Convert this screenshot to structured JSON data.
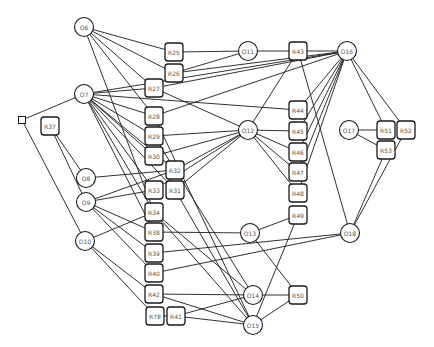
{
  "diagram": {
    "colors": {
      "stroke": "#1a1a1a",
      "fill": "#ffffff",
      "label": "#555555",
      "background": "#ffffff"
    },
    "circle_nodes": [
      {
        "id": "O6",
        "label": "O6",
        "x": 84,
        "y": 27
      },
      {
        "id": "O7",
        "label": "O7",
        "x": 84,
        "y": 94
      },
      {
        "id": "O8",
        "label": "O8",
        "x": 86,
        "y": 178
      },
      {
        "id": "O9",
        "label": "O9",
        "x": 86,
        "y": 202
      },
      {
        "id": "O10",
        "label": "O10",
        "x": 85,
        "y": 241
      },
      {
        "id": "O11",
        "label": "O11",
        "x": 248,
        "y": 51
      },
      {
        "id": "O12",
        "label": "O12",
        "x": 248,
        "y": 130
      },
      {
        "id": "O13",
        "label": "O13",
        "x": 250,
        "y": 233
      },
      {
        "id": "O14",
        "label": "O14",
        "x": 253,
        "y": 295
      },
      {
        "id": "O15",
        "label": "O15",
        "x": 253,
        "y": 325
      },
      {
        "id": "O16",
        "label": "O16",
        "x": 347,
        "y": 51
      },
      {
        "id": "O17",
        "label": "O17",
        "x": 349,
        "y": 130
      },
      {
        "id": "O18",
        "label": "O18",
        "x": 350,
        "y": 233
      }
    ],
    "rect_nodes": [
      {
        "id": "R25",
        "label": "R25",
        "x": 174,
        "y": 52
      },
      {
        "id": "R26",
        "label": "R26",
        "x": 174,
        "y": 73
      },
      {
        "id": "R27",
        "label": "R27",
        "x": 154,
        "y": 88
      },
      {
        "id": "R28",
        "label": "R28",
        "x": 154,
        "y": 116
      },
      {
        "id": "R29",
        "label": "R29",
        "x": 154,
        "y": 136
      },
      {
        "id": "R30",
        "label": "R30",
        "x": 154,
        "y": 156
      },
      {
        "id": "R32",
        "label": "R32",
        "x": 175,
        "y": 170
      },
      {
        "id": "R33",
        "label": "R33",
        "x": 154,
        "y": 190
      },
      {
        "id": "R31",
        "label": "R31",
        "x": 175,
        "y": 190
      },
      {
        "id": "R34",
        "label": "R34",
        "x": 154,
        "y": 212
      },
      {
        "id": "R38",
        "label": "R38",
        "x": 154,
        "y": 232
      },
      {
        "id": "R39",
        "label": "R39",
        "x": 154,
        "y": 253
      },
      {
        "id": "R40",
        "label": "R40",
        "x": 154,
        "y": 273
      },
      {
        "id": "R42",
        "label": "R42",
        "x": 154,
        "y": 294
      },
      {
        "id": "R78",
        "label": "R78",
        "x": 155,
        "y": 316
      },
      {
        "id": "R41",
        "label": "R41",
        "x": 176,
        "y": 316
      },
      {
        "id": "R37",
        "label": "R37",
        "x": 50,
        "y": 126
      },
      {
        "id": "R43",
        "label": "R43",
        "x": 298,
        "y": 51
      },
      {
        "id": "R44",
        "label": "R44",
        "x": 298,
        "y": 110
      },
      {
        "id": "R45",
        "label": "R45",
        "x": 298,
        "y": 131
      },
      {
        "id": "R46",
        "label": "R46",
        "x": 298,
        "y": 152
      },
      {
        "id": "R47",
        "label": "R47",
        "x": 298,
        "y": 172
      },
      {
        "id": "R48",
        "label": "R48",
        "x": 298,
        "y": 193
      },
      {
        "id": "R49",
        "label": "R49",
        "x": 298,
        "y": 215
      },
      {
        "id": "R50",
        "label": "R50",
        "x": 298,
        "y": 295
      },
      {
        "id": "R51",
        "label": "R51",
        "x": 386,
        "y": 130
      },
      {
        "id": "R52",
        "label": "R52",
        "x": 406,
        "y": 130
      },
      {
        "id": "R53",
        "label": "R53",
        "x": 386,
        "y": 150
      }
    ],
    "small_nodes": [
      {
        "id": "S0",
        "x": 22,
        "y": 120
      }
    ],
    "edges": [
      [
        "O6",
        "R25"
      ],
      [
        "O6",
        "R26"
      ],
      [
        "O6",
        "R27"
      ],
      [
        "O6",
        "R28"
      ],
      [
        "O6",
        "R34"
      ],
      [
        "O7",
        "S0"
      ],
      [
        "O7",
        "R27"
      ],
      [
        "O7",
        "R28"
      ],
      [
        "O7",
        "R29"
      ],
      [
        "O7",
        "R30"
      ],
      [
        "O7",
        "R32"
      ],
      [
        "O7",
        "R33"
      ],
      [
        "O7",
        "R31"
      ],
      [
        "O7",
        "R34"
      ],
      [
        "O7",
        "R38"
      ],
      [
        "O7",
        "R44"
      ],
      [
        "O7",
        "O16"
      ],
      [
        "S0",
        "O10"
      ],
      [
        "R37",
        "O8"
      ],
      [
        "R37",
        "O9"
      ],
      [
        "O8",
        "R32"
      ],
      [
        "O9",
        "R33"
      ],
      [
        "O9",
        "R32"
      ],
      [
        "O9",
        "R38"
      ],
      [
        "O9",
        "R39"
      ],
      [
        "O9",
        "R40"
      ],
      [
        "O10",
        "R34"
      ],
      [
        "O10",
        "R42"
      ],
      [
        "O10",
        "R78"
      ],
      [
        "R25",
        "O11"
      ],
      [
        "R26",
        "O11"
      ],
      [
        "R26",
        "O16"
      ],
      [
        "R27",
        "O16"
      ],
      [
        "R27",
        "O12"
      ],
      [
        "R28",
        "O16"
      ],
      [
        "R28",
        "O15"
      ],
      [
        "R29",
        "O12"
      ],
      [
        "R29",
        "O14"
      ],
      [
        "R30",
        "O12"
      ],
      [
        "R32",
        "O12"
      ],
      [
        "R31",
        "O12"
      ],
      [
        "R31",
        "O15"
      ],
      [
        "R33",
        "O12"
      ],
      [
        "R34",
        "O14"
      ],
      [
        "R34",
        "O15"
      ],
      [
        "R38",
        "O13"
      ],
      [
        "R39",
        "O18"
      ],
      [
        "R40",
        "O18"
      ],
      [
        "R42",
        "O14"
      ],
      [
        "R42",
        "O15"
      ],
      [
        "R78",
        "R41"
      ],
      [
        "R41",
        "O14"
      ],
      [
        "R41",
        "O15"
      ],
      [
        "O11",
        "R43"
      ],
      [
        "O12",
        "R43"
      ],
      [
        "O12",
        "R45"
      ],
      [
        "O12",
        "R46"
      ],
      [
        "O12",
        "R47"
      ],
      [
        "O12",
        "R48"
      ],
      [
        "R43",
        "O16"
      ],
      [
        "R43",
        "O18"
      ],
      [
        "R44",
        "O16"
      ],
      [
        "R45",
        "O16"
      ],
      [
        "R46",
        "O16"
      ],
      [
        "R47",
        "O16"
      ],
      [
        "R48",
        "O16"
      ],
      [
        "O13",
        "R49"
      ],
      [
        "O13",
        "R50"
      ],
      [
        "R49",
        "O15"
      ],
      [
        "O14",
        "R50"
      ],
      [
        "O15",
        "R50"
      ],
      [
        "O16",
        "R51"
      ],
      [
        "O16",
        "R52"
      ],
      [
        "O17",
        "R51"
      ],
      [
        "O17",
        "R53"
      ],
      [
        "R52",
        "O18"
      ],
      [
        "R53",
        "O18"
      ]
    ]
  }
}
